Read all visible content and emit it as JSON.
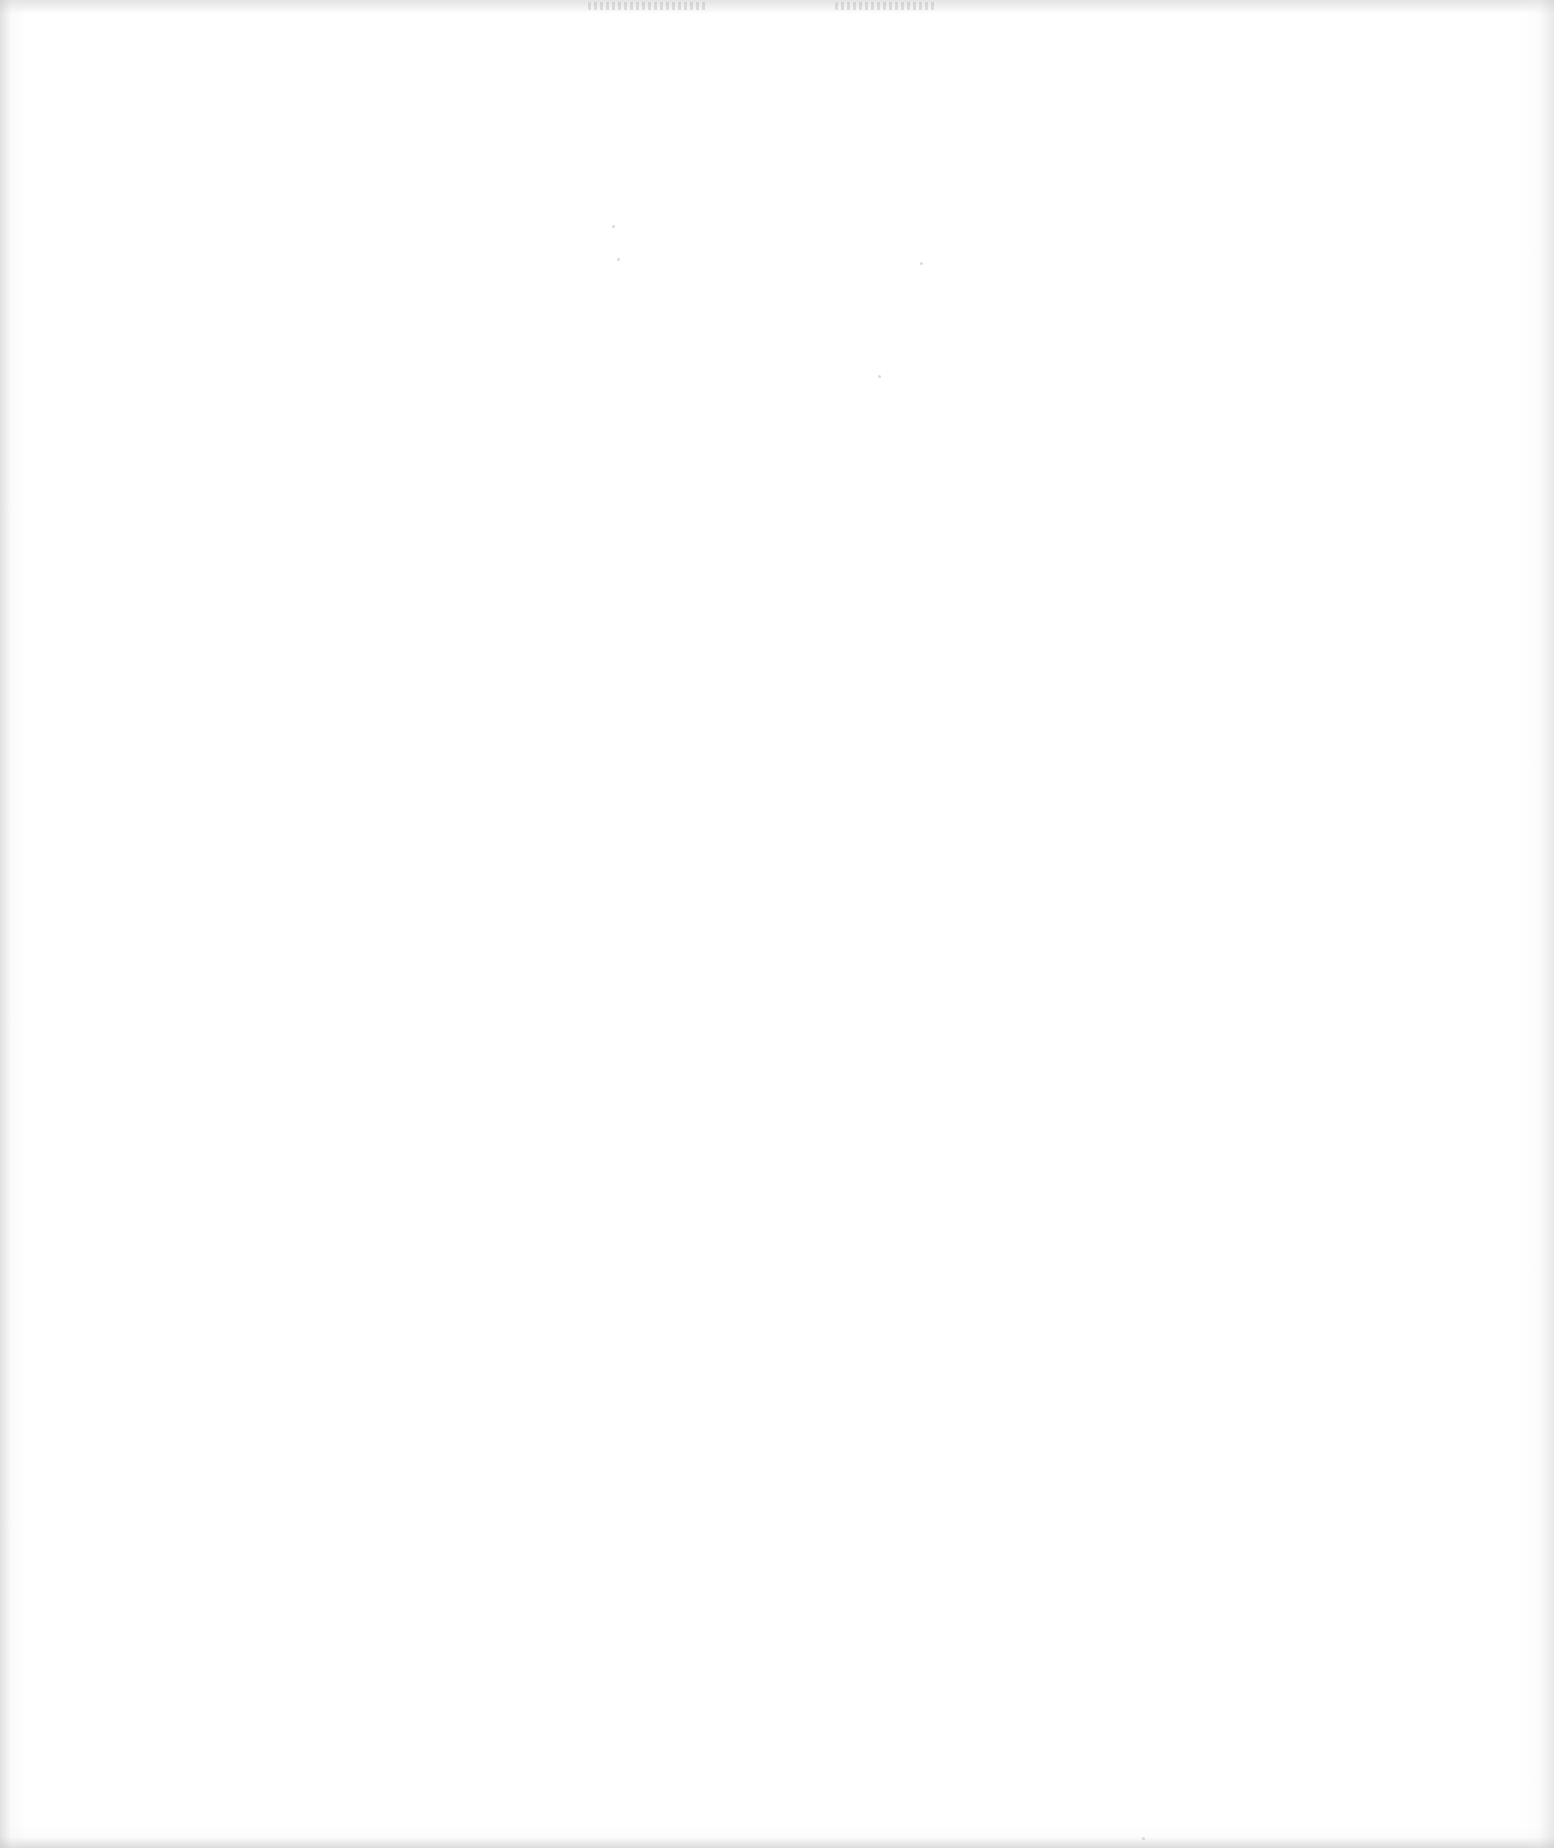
{
  "page": {
    "type": "blank scanned page",
    "background_color": "#ffffff",
    "edge_shadow_color": "#c8c8c8",
    "visible_text": []
  },
  "artifacts": {
    "top_show_through": [
      {
        "x": 588,
        "y": 2,
        "width": 120
      },
      {
        "x": 835,
        "y": 2,
        "width": 100
      }
    ],
    "specks": [
      {
        "x": 612,
        "y": 225
      },
      {
        "x": 617,
        "y": 258
      },
      {
        "x": 920,
        "y": 262
      },
      {
        "x": 878,
        "y": 375
      },
      {
        "x": 1142,
        "y": 1837
      }
    ]
  }
}
